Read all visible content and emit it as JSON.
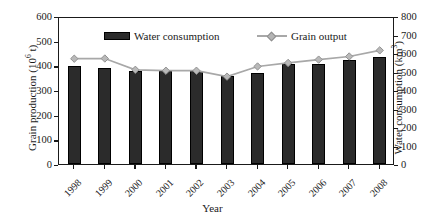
{
  "chart_data": {
    "type": "bar",
    "title": "",
    "subtitle": "",
    "xlabel": "Year",
    "ylabel": "Grain production (10^6 t)",
    "ylabel_secondary": "Water consumption (km^3)",
    "categories": [
      "1998",
      "1999",
      "2000",
      "2001",
      "2002",
      "2003",
      "2004",
      "2005",
      "2006",
      "2007",
      "2008"
    ],
    "ylim": [
      0,
      600
    ],
    "ylim_secondary": [
      0,
      800
    ],
    "yticks": [
      0,
      100,
      200,
      300,
      400,
      500,
      600
    ],
    "yticks_secondary": [
      0,
      100,
      200,
      300,
      400,
      500,
      600,
      700,
      800
    ],
    "grid": false,
    "legend_position": "top-inside",
    "series": [
      {
        "name": "Water consumption",
        "type": "bar",
        "axis": "left",
        "color": "#2b2b2b",
        "values": [
          398,
          390,
          378,
          378,
          379,
          357,
          370,
          407,
          406,
          420,
          435
        ]
      },
      {
        "name": "Grain output",
        "type": "line",
        "axis": "right",
        "color": "#a8a8a8",
        "marker": "diamond",
        "values": [
          580,
          581,
          520,
          515,
          515,
          483,
          538,
          557,
          575,
          592,
          625
        ]
      }
    ]
  },
  "axes": {
    "left": {
      "title_main": "Grain production (10",
      "title_sup": "6",
      "title_tail": " t)",
      "ticks": [
        "600",
        "500",
        "400",
        "300",
        "200",
        "100",
        "0"
      ]
    },
    "right": {
      "title_main": "Water consumption (km",
      "title_sup": "3",
      "title_tail": ")",
      "ticks": [
        "800",
        "700",
        "600",
        "500",
        "400",
        "300",
        "200",
        "100",
        "0"
      ]
    },
    "bottom": {
      "title": "Year",
      "ticks": [
        "1998",
        "1999",
        "2000",
        "2001",
        "2002",
        "2003",
        "2004",
        "2005",
        "2006",
        "2007",
        "2008"
      ]
    }
  },
  "legend": {
    "items": [
      {
        "label": "Water consumption",
        "marker": "bar-swatch",
        "color": "#2b2b2b"
      },
      {
        "label": "Grain output",
        "marker": "line-diamond",
        "color": "#a8a8a8"
      }
    ]
  }
}
